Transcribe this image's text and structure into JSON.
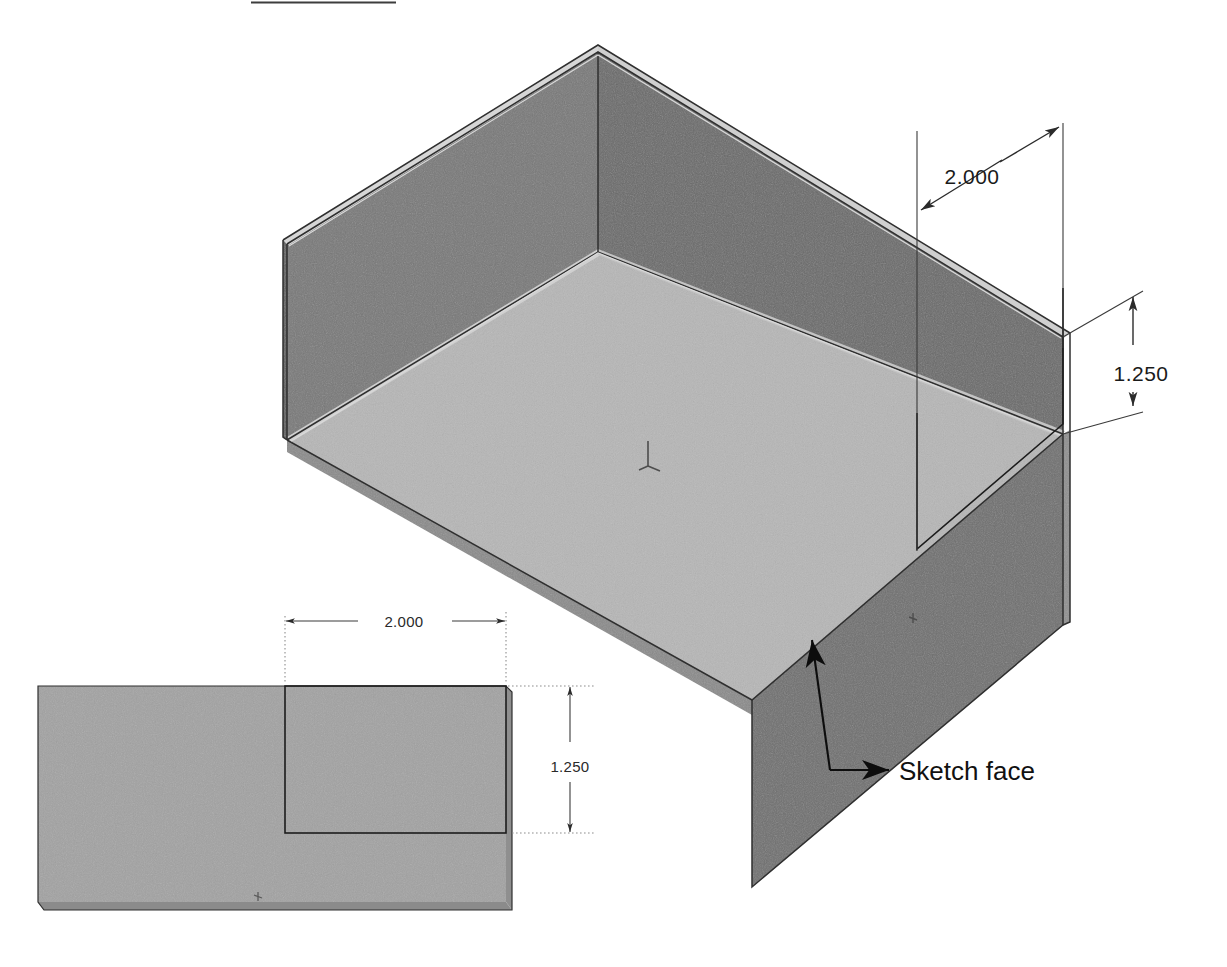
{
  "document": {
    "title": "Sketch face on 3D part - dimensioned views",
    "background_color": "#ffffff",
    "width": 1227,
    "height": 967
  },
  "palette": {
    "floor_fill": "#b6b6b6",
    "left_wall_fill": "#767676",
    "back_wall_fill": "#6b6b6b",
    "front_wall_fill": "#6e6e6e",
    "rim_highlight": "#d2d2d2",
    "flat_view_fill": "#a2a2a2",
    "flat_view_edge": "#7d7d7d",
    "dimension_color": "#2b2b2b",
    "extension_color": "#8d8d8d",
    "leader_color": "#0d0d0d",
    "sketch_color": "#1c1c1c"
  },
  "iso_view": {
    "name": "isometric-box-view",
    "description": "Open-top rectangular tray shown in isometric orientation",
    "origin_marker": "origin-axis-marker",
    "dimensions": [
      {
        "id": "iso-width-dim",
        "value": "2.000",
        "orientation": "inclined",
        "label_x": 972,
        "label_y": 184
      },
      {
        "id": "iso-height-dim",
        "value": "1.250",
        "orientation": "vertical",
        "label_x": 1140,
        "label_y": 373
      }
    ],
    "annotations": [
      {
        "id": "sketch-face-callout",
        "text": "Sketch face",
        "label_x": 899,
        "label_y": 770
      }
    ],
    "sketch_rectangle": {
      "id": "iso-sketch-rectangle",
      "on_face": "front-right-wall"
    }
  },
  "flat_view": {
    "name": "flat-face-view",
    "description": "Flat elevation of the sketch face with the sketch rectangle",
    "dimensions": [
      {
        "id": "flat-width-dim",
        "value": "2.000",
        "orientation": "horizontal",
        "label_x": 404,
        "label_y": 626
      },
      {
        "id": "flat-height-dim",
        "value": "1.250",
        "orientation": "vertical",
        "label_x": 570,
        "label_y": 766
      }
    ],
    "sketch_rectangle": {
      "id": "flat-sketch-rectangle"
    }
  }
}
